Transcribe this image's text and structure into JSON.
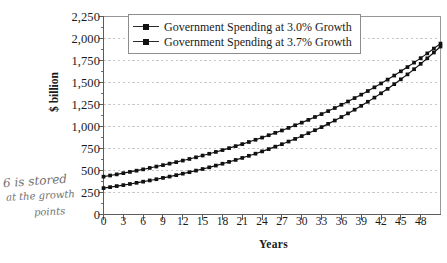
{
  "chart_data": {
    "type": "line",
    "title": "",
    "xlabel": "Years",
    "ylabel": "$ billion",
    "xlim": [
      0,
      51
    ],
    "ylim": [
      0,
      2250
    ],
    "grid": true,
    "legend_position": "top-center",
    "x_ticks": [
      "0",
      "3",
      "6",
      "9",
      "12",
      "15",
      "18",
      "21",
      "24",
      "27",
      "30",
      "33",
      "36",
      "39",
      "42",
      "45",
      "48"
    ],
    "y_ticks": [
      "0",
      "250",
      "500",
      "750",
      "1,000",
      "1,250",
      "1,500",
      "1,750",
      "2,000",
      "2,250"
    ],
    "y_tick_values": [
      0,
      250,
      500,
      750,
      1000,
      1250,
      1500,
      1750,
      2000,
      2250
    ],
    "x": [
      0,
      1,
      2,
      3,
      4,
      5,
      6,
      7,
      8,
      9,
      10,
      11,
      12,
      13,
      14,
      15,
      16,
      17,
      18,
      19,
      20,
      21,
      22,
      23,
      24,
      25,
      26,
      27,
      28,
      29,
      30,
      31,
      32,
      33,
      34,
      35,
      36,
      37,
      38,
      39,
      40,
      41,
      42,
      43,
      44,
      45,
      46,
      47,
      48,
      49,
      50,
      51
    ],
    "series": [
      {
        "name": "Government Spending at 3.0% Growth",
        "growth_rate_percent": 3.0,
        "start_value": 430,
        "marker": "square",
        "color": "#111111",
        "values": [
          430,
          443,
          456,
          470,
          484,
          498,
          513,
          529,
          545,
          561,
          578,
          595,
          613,
          631,
          650,
          670,
          690,
          711,
          732,
          754,
          777,
          800,
          824,
          849,
          874,
          901,
          928,
          955,
          984,
          1014,
          1044,
          1075,
          1108,
          1141,
          1175,
          1210,
          1247,
          1284,
          1323,
          1362,
          1403,
          1445,
          1489,
          1533,
          1579,
          1627,
          1675,
          1726,
          1777,
          1831,
          1886,
          1942
        ]
      },
      {
        "name": "Government Spending at 3.7% Growth",
        "growth_rate_percent": 3.7,
        "start_value": 300,
        "marker": "square",
        "color": "#111111",
        "values": [
          300,
          311,
          323,
          334,
          347,
          360,
          373,
          387,
          401,
          416,
          431,
          447,
          464,
          481,
          499,
          517,
          536,
          556,
          577,
          598,
          620,
          643,
          667,
          691,
          717,
          743,
          771,
          799,
          829,
          859,
          891,
          924,
          958,
          993,
          1030,
          1068,
          1108,
          1149,
          1191,
          1235,
          1281,
          1328,
          1377,
          1428,
          1481,
          1536,
          1592,
          1651,
          1712,
          1775,
          1841,
          1909
        ]
      }
    ]
  },
  "annotation": {
    "line1": "6 is stored",
    "line2": "at the growth",
    "line3": "points"
  },
  "legend": {
    "entries": [
      {
        "label": "Government Spending at 3.0% Growth"
      },
      {
        "label": "Government Spending at 3.7% Growth"
      }
    ]
  },
  "axes": {
    "y_axis_title": "$ billion",
    "x_axis_title": "Years"
  },
  "colors": {
    "series_line": "#111111",
    "grid": "#b9b9b9",
    "axis": "#5c5c5c",
    "plot_border": "#8d8d8d",
    "background": "#ffffff"
  }
}
